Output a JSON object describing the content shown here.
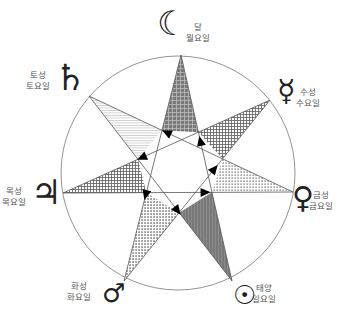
{
  "diagram": {
    "title": "",
    "center": [
      178,
      173
    ],
    "radius": 117,
    "line_color": "#555555",
    "fill_dark": "#6e6e6e",
    "fill_mid": "#8a8a8a",
    "sequence_note": "",
    "vertices": [
      {
        "id": "moon",
        "x": 181,
        "y": 55,
        "symbol": "☾",
        "planet": "달",
        "weekday": "월요일",
        "pattern": "grid-dark"
      },
      {
        "id": "mercury",
        "x": 270,
        "y": 100,
        "symbol": "☿",
        "planet": "수성",
        "weekday": "수요일",
        "pattern": "check"
      },
      {
        "id": "venus",
        "x": 293,
        "y": 192,
        "symbol": "♀",
        "planet": "금성",
        "weekday": "금요일",
        "pattern": "dots"
      },
      {
        "id": "sun",
        "x": 232,
        "y": 281,
        "symbol": "☉",
        "planet": "태양",
        "weekday": "일요일",
        "pattern": "vstripe"
      },
      {
        "id": "mars",
        "x": 124,
        "y": 281,
        "symbol": "♂",
        "planet": "화성",
        "weekday": "화요일",
        "pattern": "dots2"
      },
      {
        "id": "jupiter",
        "x": 63,
        "y": 193,
        "symbol": "♃",
        "planet": "목성",
        "weekday": "목요일",
        "pattern": "check"
      },
      {
        "id": "saturn",
        "x": 89,
        "y": 96,
        "symbol": "♄",
        "planet": "토성",
        "weekday": "토요일",
        "pattern": "hstripe"
      }
    ],
    "path_order": [
      "sun",
      "moon",
      "mars",
      "mercury",
      "jupiter",
      "venus",
      "saturn",
      "sun"
    ],
    "labels": {
      "moon": {
        "sym_x": 160,
        "sym_y": 6,
        "sym_size": 34,
        "text_x": 200,
        "text_y": 22
      },
      "mercury": {
        "sym_x": 278,
        "sym_y": 76,
        "sym_size": 30,
        "text_x": 310,
        "text_y": 87
      },
      "venus": {
        "sym_x": 293,
        "sym_y": 183,
        "sym_size": 30,
        "text_x": 323,
        "text_y": 190
      },
      "sun": {
        "sym_x": 232,
        "sym_y": 282,
        "sym_size": 26,
        "text_x": 266,
        "text_y": 283
      },
      "mars": {
        "sym_x": 101,
        "sym_y": 280,
        "sym_size": 26,
        "text_x": 81,
        "text_y": 281
      },
      "jupiter": {
        "sym_x": 34,
        "sym_y": 175,
        "sym_size": 34,
        "text_x": 16,
        "text_y": 186
      },
      "saturn": {
        "sym_x": 58,
        "sym_y": 60,
        "sym_size": 36,
        "text_x": 40,
        "text_y": 70
      }
    }
  }
}
